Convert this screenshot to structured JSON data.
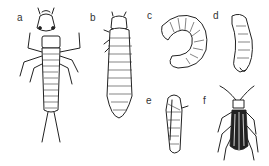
{
  "figure": {
    "panels": [
      {
        "label": "a",
        "subject": "elongated larva with legs and tail filaments"
      },
      {
        "label": "b",
        "subject": "segmented larva, dorsal view"
      },
      {
        "label": "c",
        "subject": "C-shaped grub"
      },
      {
        "label": "d",
        "subject": "curved slender larva"
      },
      {
        "label": "e",
        "subject": "pupa"
      },
      {
        "label": "f",
        "subject": "adult beetle"
      }
    ]
  }
}
